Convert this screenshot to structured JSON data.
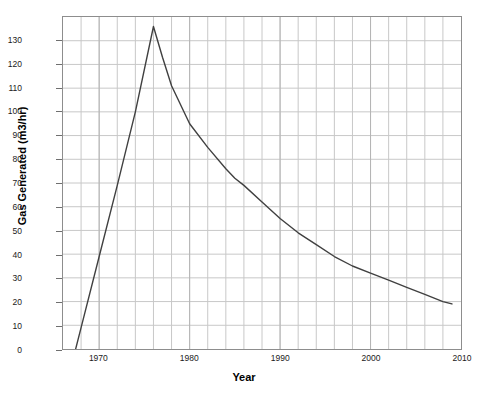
{
  "chart_data": {
    "type": "line",
    "title": "",
    "xlabel": "Year",
    "ylabel": "Gas Generated (m3/hr)",
    "xlim": [
      1966,
      2010
    ],
    "ylim": [
      0,
      140
    ],
    "grid": true,
    "legend": false,
    "legend_position": "none",
    "yticks": [
      0,
      10,
      20,
      30,
      40,
      50,
      60,
      70,
      80,
      90,
      100,
      110,
      120,
      130
    ],
    "ytick_labels": [
      "0",
      "10",
      "20",
      "30",
      "40",
      "50",
      "60",
      "70",
      "80",
      "90",
      "100",
      "110",
      "120",
      "130"
    ],
    "xticks": [
      1970,
      1980,
      1990,
      2000,
      2010
    ],
    "xtick_labels": [
      "1970",
      "1980",
      "1990",
      "2000",
      "2010"
    ],
    "x_minor_step": 2,
    "y_minor_step": 10,
    "line_color": "#404040",
    "grid_color": "#c8c8c8",
    "frame_color": "#8d8d8d",
    "series": [
      {
        "name": "Gas Generated",
        "x": [
          1967.4,
          1968,
          1970,
          1972,
          1974,
          1976,
          1977,
          1978,
          1980,
          1982,
          1984,
          1985,
          1986,
          1988,
          1990,
          1992,
          1994,
          1996,
          1998,
          2000,
          2002,
          2004,
          2006,
          2008,
          2009
        ],
        "values": [
          0,
          9,
          39,
          69,
          100,
          136,
          123,
          111,
          95,
          85,
          76,
          72,
          69,
          62,
          55,
          49,
          44,
          39,
          35,
          32,
          29,
          26,
          23,
          20,
          19
        ]
      }
    ],
    "peak": {
      "x": 1976,
      "y": 136
    },
    "start": {
      "x": 1967.4,
      "y": 0
    },
    "end": {
      "x": 2009,
      "y": 19
    }
  }
}
